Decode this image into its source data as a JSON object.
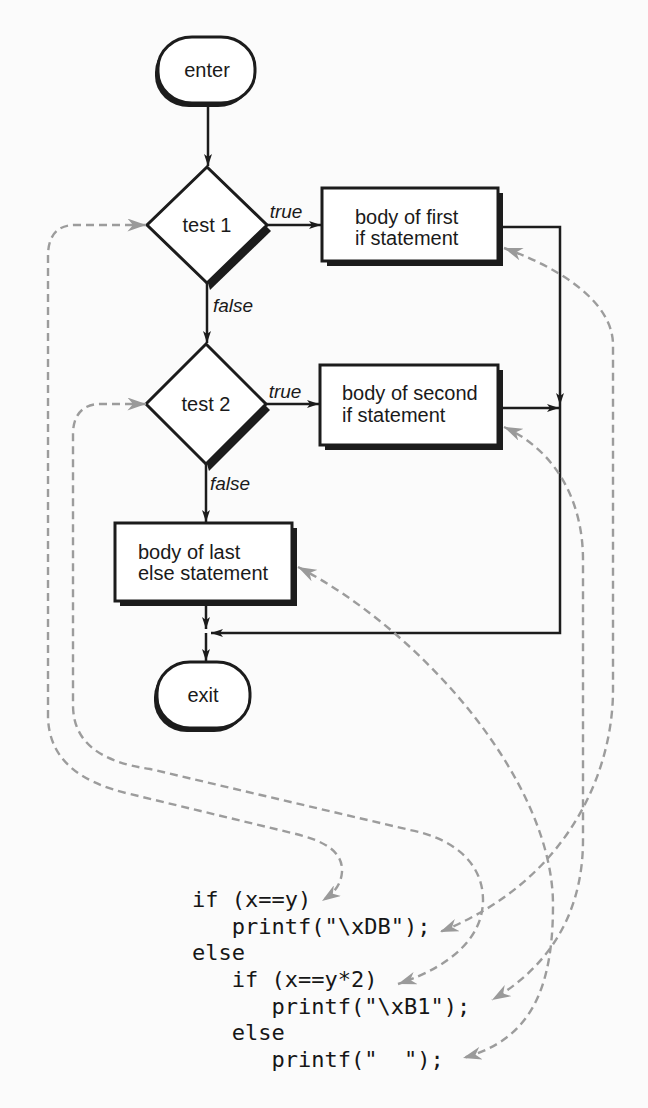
{
  "diagram": {
    "start_node": {
      "label": "enter"
    },
    "decisions": [
      {
        "label": "test 1",
        "true_label": "true",
        "false_label": "false"
      },
      {
        "label": "test 2",
        "true_label": "true",
        "false_label": "false"
      }
    ],
    "bodies": [
      {
        "lines": [
          "body of first",
          "if statement"
        ]
      },
      {
        "lines": [
          "body of second",
          "if statement"
        ]
      },
      {
        "lines": [
          "body of last",
          "else statement"
        ]
      }
    ],
    "end_node": {
      "label": "exit"
    },
    "colors": {
      "ink": "#1c1c1c",
      "dashed_link": "#9c9c9c",
      "paper": "#fbfbfb",
      "shape_fill": "#ffffff"
    }
  },
  "code": {
    "lines": [
      "if (x==y)",
      "   printf(\"\\xDB\");",
      "else",
      "   if (x==y*2)",
      "      printf(\"\\xB1\");",
      "   else",
      "      printf(\"  \");"
    ]
  },
  "links": [
    {
      "from": "test 1",
      "to_code_line": 0
    },
    {
      "from": "body of first if statement",
      "to_code_line": 1
    },
    {
      "from": "test 2",
      "to_code_line": 3
    },
    {
      "from": "body of second if statement",
      "to_code_line": 4
    },
    {
      "from": "body of last else statement",
      "to_code_line": 6
    }
  ]
}
